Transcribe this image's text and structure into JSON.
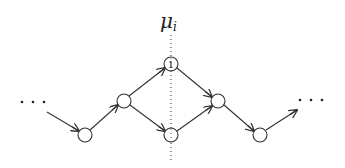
{
  "diagram": {
    "title": {
      "symbol": "μ",
      "subscript": "i"
    },
    "divider": {
      "x": 171,
      "y1": 35,
      "y2": 160,
      "style": "dotted"
    },
    "nodes": [
      {
        "id": "n-bottom-left",
        "cx": 85,
        "cy": 135,
        "label": ""
      },
      {
        "id": "n-left-mid",
        "cx": 124,
        "cy": 101,
        "label": ""
      },
      {
        "id": "n-top",
        "cx": 171,
        "cy": 64,
        "label": "1"
      },
      {
        "id": "n-bottom-center",
        "cx": 171,
        "cy": 135,
        "label": ""
      },
      {
        "id": "n-right-mid",
        "cx": 218,
        "cy": 101,
        "label": ""
      },
      {
        "id": "n-bottom-right",
        "cx": 260,
        "cy": 135,
        "label": ""
      }
    ],
    "node_radius": 7,
    "edges": [
      {
        "from": "ellipsis-left",
        "to": "n-bottom-left"
      },
      {
        "from": "n-bottom-left",
        "to": "n-left-mid"
      },
      {
        "from": "n-left-mid",
        "to": "n-top"
      },
      {
        "from": "n-left-mid",
        "to": "n-bottom-center"
      },
      {
        "from": "n-top",
        "to": "n-right-mid"
      },
      {
        "from": "n-bottom-center",
        "to": "n-right-mid"
      },
      {
        "from": "n-right-mid",
        "to": "n-bottom-right"
      },
      {
        "from": "n-bottom-right",
        "to": "ellipsis-right"
      }
    ],
    "ellipsis_left": "…",
    "ellipsis_right": "…",
    "colors": {
      "stroke": "#333333",
      "background": "#ffffff"
    }
  }
}
